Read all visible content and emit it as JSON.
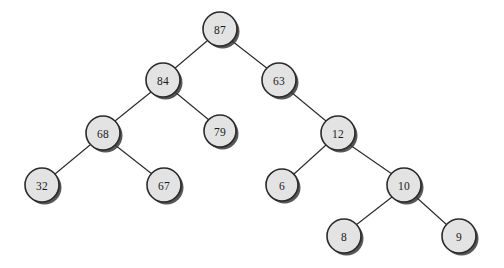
{
  "figure": {
    "kind": "binary-tree-diagram",
    "background_color": "#ffffff",
    "node_fill_color": "#e3e3e3",
    "node_stroke_color": "#2a2a2a",
    "edge_color": "#2b2b2b",
    "label_color": "#1a1a1a",
    "node_radius": 17
  },
  "nodes": [
    {
      "id": "n87",
      "label": "87",
      "cx": 220,
      "cy": 29,
      "r": 17
    },
    {
      "id": "n84",
      "label": "84",
      "cx": 163,
      "cy": 80,
      "r": 17
    },
    {
      "id": "n63",
      "label": "63",
      "cx": 279,
      "cy": 80,
      "r": 17
    },
    {
      "id": "n68",
      "label": "68",
      "cx": 103,
      "cy": 133,
      "r": 17
    },
    {
      "id": "n79",
      "label": "79",
      "cx": 220,
      "cy": 131,
      "r": 16
    },
    {
      "id": "n12",
      "label": "12",
      "cx": 338,
      "cy": 133,
      "r": 17
    },
    {
      "id": "n32",
      "label": "32",
      "cx": 42,
      "cy": 185,
      "r": 17
    },
    {
      "id": "n67",
      "label": "67",
      "cx": 164,
      "cy": 185,
      "r": 17
    },
    {
      "id": "n6",
      "label": "6",
      "cx": 282,
      "cy": 185,
      "r": 16
    },
    {
      "id": "n10",
      "label": "10",
      "cx": 404,
      "cy": 185,
      "r": 17
    },
    {
      "id": "n8",
      "label": "8",
      "cx": 344,
      "cy": 236,
      "r": 17
    },
    {
      "id": "n9",
      "label": "9",
      "cx": 459,
      "cy": 236,
      "r": 17
    }
  ],
  "edges": [
    {
      "id": "e87-84",
      "from": "n87",
      "to": "n84",
      "x1": 207,
      "y1": 41,
      "x2": 174,
      "y2": 69
    },
    {
      "id": "e87-63",
      "from": "n87",
      "to": "n63",
      "x1": 232,
      "y1": 41,
      "x2": 268,
      "y2": 69
    },
    {
      "id": "e84-68",
      "from": "n84",
      "to": "n68",
      "x1": 151,
      "y1": 92,
      "x2": 115,
      "y2": 121
    },
    {
      "id": "e84-79",
      "from": "n84",
      "to": "n79",
      "x1": 175,
      "y1": 92,
      "x2": 209,
      "y2": 120
    },
    {
      "id": "e68-32",
      "from": "n68",
      "to": "n32",
      "x1": 90,
      "y1": 145,
      "x2": 55,
      "y2": 174
    },
    {
      "id": "e68-67",
      "from": "n68",
      "to": "n67",
      "x1": 115,
      "y1": 145,
      "x2": 152,
      "y2": 174
    },
    {
      "id": "e63-12",
      "from": "n63",
      "to": "n12",
      "x1": 291,
      "y1": 92,
      "x2": 326,
      "y2": 121
    },
    {
      "id": "e12-6",
      "from": "n12",
      "to": "n6",
      "x1": 326,
      "y1": 145,
      "x2": 294,
      "y2": 174
    },
    {
      "id": "e12-10",
      "from": "n12",
      "to": "n10",
      "x1": 350,
      "y1": 145,
      "x2": 392,
      "y2": 174
    },
    {
      "id": "e10-8",
      "from": "n10",
      "to": "n8",
      "x1": 392,
      "y1": 197,
      "x2": 356,
      "y2": 225
    },
    {
      "id": "e10-9",
      "from": "n10",
      "to": "n9",
      "x1": 416,
      "y1": 197,
      "x2": 447,
      "y2": 225
    }
  ],
  "tree_structure": {
    "root": "87",
    "relations": [
      {
        "parent": "87",
        "left": "84",
        "right": "63"
      },
      {
        "parent": "84",
        "left": "68",
        "right": "79"
      },
      {
        "parent": "68",
        "left": "32",
        "right": "67"
      },
      {
        "parent": "63",
        "left": null,
        "right": "12"
      },
      {
        "parent": "12",
        "left": "6",
        "right": "10"
      },
      {
        "parent": "10",
        "left": "8",
        "right": "9"
      }
    ],
    "leaves": [
      "32",
      "67",
      "79",
      "6",
      "8",
      "9"
    ]
  }
}
